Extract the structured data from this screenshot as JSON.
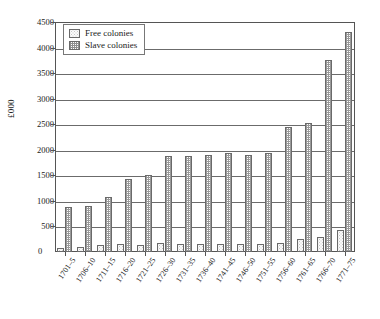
{
  "chart_data": {
    "type": "bar",
    "title": "",
    "xlabel": "",
    "ylabel": "£000",
    "ylim": [
      0,
      4500
    ],
    "ytick_step": 500,
    "yticks": [
      0,
      500,
      1000,
      1500,
      2000,
      2500,
      3000,
      3500,
      4000,
      4500
    ],
    "grid": true,
    "legend_position": "top-left",
    "categories": [
      "1701–5",
      "1706–10",
      "1711–15",
      "1716–20",
      "1721–25",
      "1726–30",
      "1731–35",
      "1736–40",
      "1741–45",
      "1746–50",
      "1751–55",
      "1756–60",
      "1761–65",
      "1766–70",
      "1771–75"
    ],
    "series": [
      {
        "name": "Free colonies",
        "values": [
          70,
          90,
          130,
          150,
          140,
          170,
          160,
          165,
          155,
          150,
          160,
          185,
          250,
          300,
          430
        ]
      },
      {
        "name": "Slave colonies",
        "values": [
          880,
          900,
          1070,
          1420,
          1500,
          1880,
          1880,
          1900,
          1930,
          1900,
          1930,
          2450,
          2520,
          3750,
          4300
        ]
      }
    ]
  },
  "legend": {
    "entries": [
      {
        "label": "Free colonies",
        "swatch": "light-dotted"
      },
      {
        "label": "Slave colonies",
        "swatch": "dark-checkered"
      }
    ]
  },
  "axis": {
    "zero_label": "0",
    "y_title": "£000"
  },
  "colors": {
    "frame": "#555555",
    "gridline": "#6b6b6b",
    "bar_outline": "#6a6a6a",
    "free_fill": "#fbfbfb",
    "slave_fill": "#9a9a9a",
    "background": "#ffffff"
  }
}
